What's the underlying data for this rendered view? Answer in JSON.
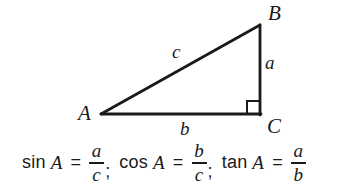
{
  "figure": {
    "background_color": "#ffffff",
    "stroke_color": "#1a1a1a",
    "text_color": "#1a1a1a"
  },
  "triangle": {
    "vertices": [
      {
        "name": "A",
        "label": "A",
        "x": 101,
        "y": 114,
        "angle_role": "reference-angle"
      },
      {
        "name": "B",
        "label": "B",
        "x": 260,
        "y": 25,
        "angle_role": "acute"
      },
      {
        "name": "C",
        "label": "C",
        "x": 260,
        "y": 114,
        "angle_role": "right-angle"
      }
    ],
    "sides": [
      {
        "name": "a",
        "label": "a",
        "between": "B-C",
        "role": "opposite"
      },
      {
        "name": "b",
        "label": "b",
        "between": "A-C",
        "role": "adjacent"
      },
      {
        "name": "c",
        "label": "c",
        "between": "A-B",
        "role": "hypotenuse"
      }
    ],
    "right_angle_marker": {
      "at": "C",
      "size": 13
    }
  },
  "formulas": [
    {
      "function": "sin",
      "argument": "A",
      "equals": "=",
      "numerator": "a",
      "denominator": "c",
      "separator": ";"
    },
    {
      "function": "cos",
      "argument": "A",
      "equals": "=",
      "numerator": "b",
      "denominator": "c",
      "separator": ";"
    },
    {
      "function": "tan",
      "argument": "A",
      "equals": "=",
      "numerator": "a",
      "denominator": "b",
      "separator": ""
    }
  ]
}
